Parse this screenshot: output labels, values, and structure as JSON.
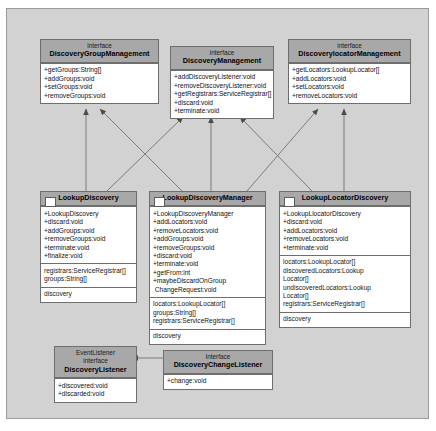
{
  "diagram": {
    "type": "uml-class-diagram",
    "canvas_bg": "#d2d2d2",
    "header_bg": "#a8a8a8",
    "body_bg": "#ffffff",
    "border_color": "#6e6e6e"
  },
  "nodes": {
    "discovery_group_management": {
      "stereotype": "interface",
      "name": "DiscoveryGroupManagement",
      "operations": [
        "+getGroups:String[]",
        "+addGroups:void",
        "+setGroups:void",
        "+removeGroups:void"
      ],
      "attributes": []
    },
    "discovery_management": {
      "stereotype": "interface",
      "name": "DiscoveryManagement",
      "operations": [
        "+addDiscoveryListener:void",
        "+removeDiscoveryListener:void",
        "+getRegistrars:ServiceRegistrar[]",
        "+discard:void",
        "+terminate:void"
      ],
      "attributes": []
    },
    "discovery_locator_management": {
      "stereotype": "interface",
      "name": "DiscoverylocatorManagement",
      "operations": [
        "+getLocators:LookupLocator[]",
        "+addLocators:void",
        "+setLocators:void",
        "+removeLocators:void"
      ],
      "attributes": []
    },
    "lookup_discovery": {
      "stereotype": "",
      "name": "LookupDiscovery",
      "operations": [
        "+LookupDiscovery",
        "+discard:void",
        "+addGroups:void",
        "+removeGroups:void",
        "+terminate:void",
        "+finalize:void"
      ],
      "attributes": [
        "registrars:ServiceRegistrar[]\ngroups:String[]",
        "discovery"
      ]
    },
    "lookup_discovery_manager": {
      "stereotype": "",
      "name": "LookupDiscoveryManager",
      "operations": [
        "+LookupDiscoveryManager",
        "+addLocators:void",
        "+removeLocators:void",
        "+addGroups:void",
        "+removeGroups:void",
        "+discard:void",
        "+terminate:void",
        "+getFrom:int",
        "+maybeDiscardOnGroup\n ChangeRequest:void"
      ],
      "attributes": [
        "locators:LookupLocator[]\ngroups:String[]\nregistrars:ServiceRegistrar[]",
        "discovery"
      ]
    },
    "lookup_locator_discovery": {
      "stereotype": "",
      "name": "LookupLocatorDiscovery",
      "operations": [
        "+LookupLlocatorDiscovery",
        "+discard:void",
        "+addLocators:void",
        "+removeLocators:void",
        "+terminate:void"
      ],
      "attributes": [
        "locators:LookupLocator[]\ndiscoveredLocators:Lookup\nLocator[]\nundiscoveredLocators:Lookup\nLocator[]\nregistrars:ServiceRegistrar[]",
        "discovery"
      ]
    },
    "discovery_listener": {
      "stereotype_top": "EventListener",
      "stereotype": "interface",
      "name": "DiscoveryListener",
      "operations": [
        "+discovered:void",
        "+discarded:void"
      ],
      "attributes": []
    },
    "discovery_change_listener": {
      "stereotype": "interface",
      "name": "DiscoveryChangeListener",
      "operations": [
        "+change:void"
      ],
      "attributes": []
    }
  },
  "edges": [
    {
      "name": "lookup-discovery-to-discovery-group-management",
      "kind": "realization"
    },
    {
      "name": "lookup-discovery-to-discovery-management",
      "kind": "realization"
    },
    {
      "name": "lookup-discovery-manager-to-discovery-group-management",
      "kind": "realization"
    },
    {
      "name": "lookup-discovery-manager-to-discovery-management",
      "kind": "realization"
    },
    {
      "name": "lookup-discovery-manager-to-discovery-locator-management",
      "kind": "realization"
    },
    {
      "name": "lookup-locator-discovery-to-discovery-management",
      "kind": "realization"
    },
    {
      "name": "lookup-locator-discovery-to-discovery-locator-management",
      "kind": "realization"
    },
    {
      "name": "discovery-change-listener-to-discovery-listener",
      "kind": "generalization"
    }
  ]
}
